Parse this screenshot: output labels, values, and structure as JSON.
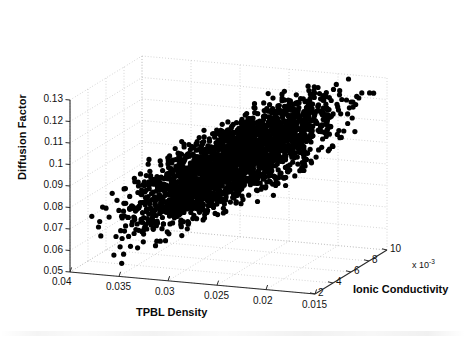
{
  "chart_data": {
    "type": "scatter",
    "projection": "3d",
    "title": "",
    "xlabel": "TPBL Density",
    "ylabel": "Diffusion Factor",
    "zlabel": "Ionic Conductivity",
    "z_multiplier": "x 10",
    "z_multiplier_exponent": "-3",
    "grid": true,
    "legend": "none",
    "marker": {
      "shape": "circle",
      "color": "#000000",
      "size": 2.6
    },
    "background_color": "#ffffff",
    "grid_color": "#b9b9b9",
    "axis_color": "#2a2a2a",
    "xticks": [
      "0.04",
      "0.035",
      "0.03",
      "0.025",
      "0.02",
      "0.015"
    ],
    "xtick_values": [
      0.04,
      0.035,
      0.03,
      0.025,
      0.02,
      0.015
    ],
    "xlim": [
      0.04,
      0.015
    ],
    "yticks": [
      "0.05",
      "0.06",
      "0.07",
      "0.08",
      "0.09",
      "0.1",
      "0.11",
      "0.12",
      "0.13"
    ],
    "ytick_values": [
      0.05,
      0.06,
      0.07,
      0.08,
      0.09,
      0.1,
      0.11,
      0.12,
      0.13
    ],
    "ylim": [
      0.05,
      0.13
    ],
    "zticks": [
      "2",
      "4",
      "6",
      "8",
      "10"
    ],
    "ztick_values": [
      0.002,
      0.004,
      0.006,
      0.008,
      0.01
    ],
    "zlim": [
      0.002,
      0.01
    ],
    "n_points": 2600,
    "cloud_description": "Dense elongated diagonal cluster of black points rising from low TPBL-density/low diffusion at lower-left to high diffusion at upper-right, with sparse outliers scattered to the right side.",
    "cloud": {
      "x_center": 0.0265,
      "x_spread": 0.0052,
      "y_center": 0.098,
      "y_spread": 0.0165,
      "z_center": 0.0055,
      "z_spread": 0.0021,
      "corr_xy": -0.78,
      "corr_xz": -0.35,
      "corr_yz": 0.3
    }
  },
  "axes": {
    "y": {
      "name": "Diffusion Factor",
      "ticks": [
        "0.13",
        "0.12",
        "0.11",
        "0.1",
        "0.09",
        "0.08",
        "0.07",
        "0.06",
        "0.05"
      ]
    },
    "x": {
      "name": "TPBL Density",
      "ticks": [
        "0.04",
        "0.035",
        "0.03",
        "0.025",
        "0.02",
        "0.015"
      ]
    },
    "z": {
      "name": "Ionic Conductivity",
      "ticks": [
        "2",
        "4",
        "6",
        "8",
        "10"
      ],
      "multiplier": "x 10",
      "exponent": "-3"
    }
  }
}
